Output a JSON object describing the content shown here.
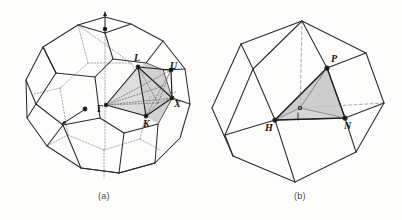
{
  "figure": {
    "background": "#fdfdfc",
    "line_color": "#2b2b2b",
    "dashed_color": "#8d8d8d",
    "wedge_fill": "#b9b9b9",
    "wedge_fill_light": "#d6d6d6"
  },
  "panels": [
    {
      "id": "a",
      "caption": "(a)",
      "caption_pos": {
        "x": 98,
        "y": 193
      },
      "solid": "truncated-octahedron",
      "lattice": "fcc",
      "wedge_points": [
        "Γ",
        "L",
        "U",
        "X",
        "K"
      ],
      "labels": [
        {
          "text": "L",
          "x": 134,
          "y": 58
        },
        {
          "text": "U",
          "x": 170,
          "y": 66
        },
        {
          "text": "X",
          "x": 174,
          "y": 102
        },
        {
          "text": "K",
          "x": 144,
          "y": 118
        },
        {
          "text": "Γ",
          "x": 99,
          "y": 100
        }
      ],
      "markers": [
        {
          "name": "top-normal-arrow",
          "x": 105,
          "y": 22
        },
        {
          "name": "face-normal-arrow",
          "x": 72,
          "y": 115
        }
      ]
    },
    {
      "id": "b",
      "caption": "(b)",
      "caption_pos": {
        "x": 294,
        "y": 193
      },
      "solid": "rhombic-dodecahedron",
      "lattice": "bcc",
      "wedge_points": [
        "Γ",
        "H",
        "N",
        "P"
      ],
      "labels": [
        {
          "text": "P",
          "x": 330,
          "y": 58
        },
        {
          "text": "N",
          "x": 345,
          "y": 121
        },
        {
          "text": "H",
          "x": 267,
          "y": 123
        }
      ],
      "markers": [
        {
          "name": "gamma-center-dot",
          "x": 300,
          "y": 105
        }
      ]
    }
  ]
}
